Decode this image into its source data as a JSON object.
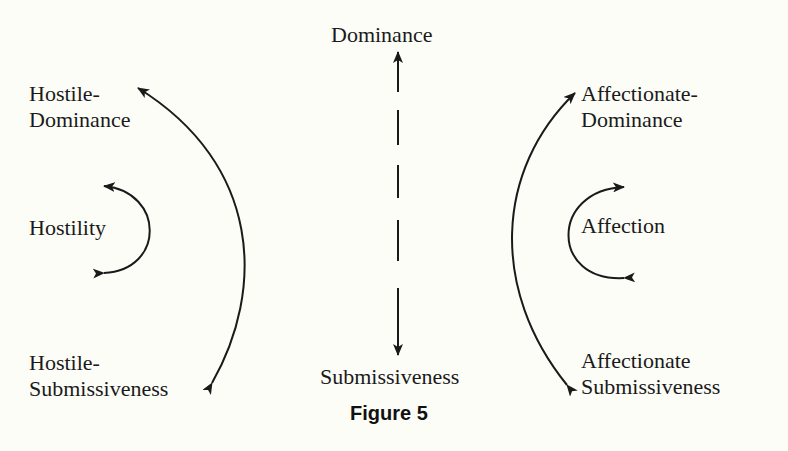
{
  "figure": {
    "caption": "Figure 5",
    "colors": {
      "background": "#fdfdf8",
      "ink": "#1a1a1a"
    },
    "labels": {
      "dominance": "Dominance",
      "submissiveness": "Submissiveness",
      "hostile_dominance_line1": "Hostile-",
      "hostile_dominance_line2": "Dominance",
      "hostility": "Hostility",
      "hostile_submissiveness_line1": "Hostile-",
      "hostile_submissiveness_line2": "Submissiveness",
      "affectionate_dominance_line1": "Affectionate-",
      "affectionate_dominance_line2": "Dominance",
      "affection": "Affection",
      "affectionate_submissiveness_line1": "Affectionate",
      "affectionate_submissiveness_line2": "Submissiveness"
    },
    "arrows": [
      {
        "name": "dominance-submissiveness-axis",
        "style": "dashed",
        "ends": "both"
      },
      {
        "name": "hostile-arc",
        "from": "Hostile-Dominance",
        "to": "Hostile-Submissiveness",
        "ends": "both"
      },
      {
        "name": "hostility-arc",
        "ends": "both"
      },
      {
        "name": "affectionate-arc",
        "from": "Affectionate-Dominance",
        "to": "Affectionate Submissiveness",
        "ends": "both"
      },
      {
        "name": "affection-arc",
        "ends": "both"
      }
    ]
  }
}
